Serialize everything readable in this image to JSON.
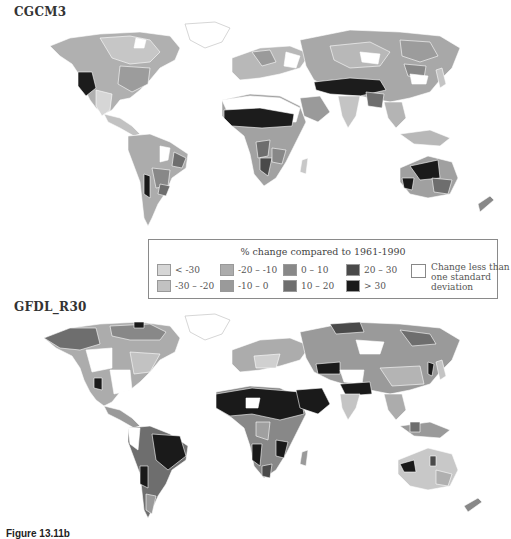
{
  "maps": [
    {
      "title": "CGCM3"
    },
    {
      "title": "GFDL_R30"
    }
  ],
  "legend": {
    "title": "% change compared to 1961-1990",
    "classes": [
      {
        "label": "< -30",
        "color": "#d6d6d6"
      },
      {
        "label": "-30 – -20",
        "color": "#c2c2c2"
      },
      {
        "label": "-20 – -10",
        "color": "#acacac"
      },
      {
        "label": "-10 – 0",
        "color": "#9a9a9a"
      },
      {
        "label": "0 – 10",
        "color": "#888888"
      },
      {
        "label": "10 – 20",
        "color": "#6e6e6e"
      },
      {
        "label": "20 – 30",
        "color": "#4a4a4a"
      },
      {
        "label": "> 30",
        "color": "#1a1a1a"
      }
    ],
    "no_change": {
      "label": "Change less than one standard deviation",
      "color": "#ffffff"
    }
  },
  "caption": {
    "label": "Figure 13.11b",
    "rest": "  Estimated changes ..."
  }
}
